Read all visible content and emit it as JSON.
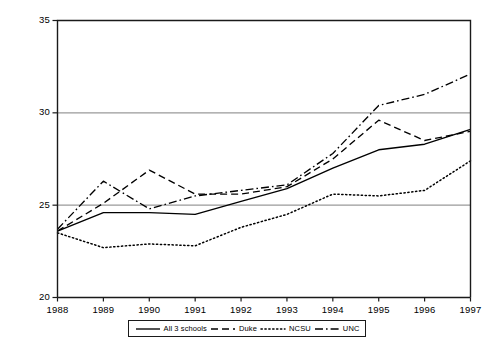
{
  "chart_data": {
    "type": "line",
    "title": "",
    "subtitle": "",
    "xlabel": "",
    "ylabel": "",
    "x": [
      1988,
      1989,
      1990,
      1991,
      1992,
      1993,
      1994,
      1995,
      1996,
      1997
    ],
    "xtick_labels": [
      "1988",
      "1989",
      "1990",
      "1991",
      "1992",
      "1993",
      "1994",
      "1995",
      "1996",
      "1997"
    ],
    "ytick_labels": [
      "20",
      "25",
      "30",
      "35"
    ],
    "ytick_values": [
      20,
      25,
      30,
      35
    ],
    "xlim": [
      1988,
      1997
    ],
    "ylim": [
      20,
      35
    ],
    "grid": "horizontal-at-25-and-30",
    "gridlines": [
      25,
      30
    ],
    "legend_position": "below-axes",
    "series": [
      {
        "name": "All 3 schools",
        "style": "solid",
        "color": "#000000",
        "values": [
          23.6,
          24.6,
          24.6,
          24.5,
          25.2,
          25.9,
          27.0,
          28.0,
          28.3,
          29.1
        ]
      },
      {
        "name": "Duke",
        "style": "dashed",
        "color": "#000000",
        "values": [
          23.6,
          25.1,
          26.9,
          25.6,
          25.6,
          26.0,
          27.5,
          29.6,
          28.5,
          29.0
        ]
      },
      {
        "name": "NCSU",
        "style": "dotted",
        "color": "#000000",
        "values": [
          23.5,
          22.7,
          22.9,
          22.8,
          23.8,
          24.5,
          25.6,
          25.5,
          25.8,
          27.4
        ]
      },
      {
        "name": "UNC",
        "style": "dash-dot",
        "color": "#000000",
        "values": [
          23.7,
          26.3,
          24.8,
          25.5,
          25.8,
          26.1,
          27.8,
          30.4,
          31.0,
          32.1
        ]
      }
    ]
  },
  "axes": {
    "frame_color": "#1a1a1a",
    "grid_color": "#9a9a9a"
  },
  "legend": {
    "entries": [
      {
        "label": "All 3 schools",
        "style": "solid"
      },
      {
        "label": "Duke",
        "style": "dashed"
      },
      {
        "label": "NCSU",
        "style": "dotted"
      },
      {
        "label": "UNC",
        "style": "dash-dot"
      }
    ]
  }
}
